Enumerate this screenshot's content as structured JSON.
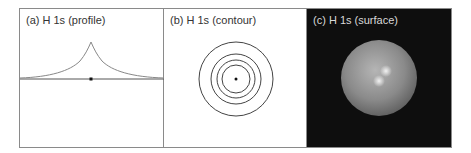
{
  "figure": {
    "panels": [
      {
        "id": "a",
        "label": "(a)  H 1s (profile)",
        "type": "profile"
      },
      {
        "id": "b",
        "label": "(b)  H 1s (contour)",
        "type": "contour"
      },
      {
        "id": "c",
        "label": "(c)  H 1s (surface)",
        "type": "surface"
      }
    ]
  },
  "colors": {
    "frame": "#8a8a8a",
    "curve": "#777777",
    "axis": "#555555",
    "nucleus": "#111111",
    "surface_background": "#0e0e0e",
    "sphere": "#8c8c8c"
  }
}
